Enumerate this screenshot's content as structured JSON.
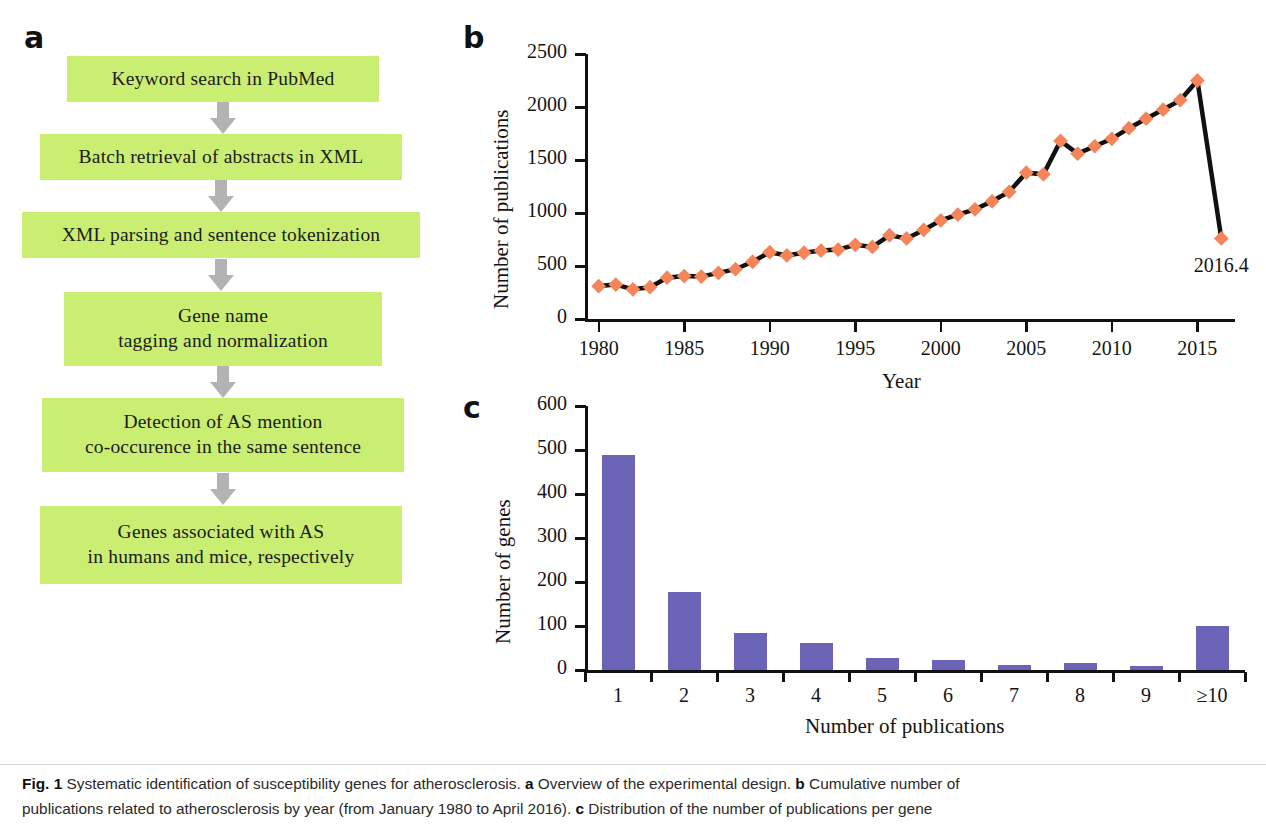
{
  "panels": {
    "a": {
      "letter": "a",
      "steps": [
        "Keyword search in PubMed",
        "Batch retrieval of abstracts in XML",
        "XML parsing and sentence tokenization",
        "Gene name\ntagging and normalization",
        "Detection of AS mention\nco-occurence in the same sentence",
        "Genes associated with AS\nin humans and mice, respectively"
      ],
      "arrow_count": 5,
      "box_color": "#c9ee72",
      "arrow_color": "#b3b3b3"
    },
    "b": {
      "letter": "b"
    },
    "c": {
      "letter": "c"
    }
  },
  "caption": {
    "figure_number": "Fig. 1",
    "line1_part1": " Systematic identification of susceptibility genes for atherosclerosis. ",
    "a_tag": "a",
    "line1_part2": " Overview of the experimental design. ",
    "b_tag": "b",
    "line1_part3": " Cumulative number of",
    "line2_part1": "publications related to atherosclerosis by year (from January 1980 to April 2016). ",
    "c_tag": "c",
    "line2_part2": " Distribution of the number of publications per gene"
  },
  "chart_data": [
    {
      "id": "panel-b",
      "type": "line",
      "title": "",
      "xlabel": "Year",
      "ylabel": "Number of publications",
      "xlim": [
        1979.2,
        2017.2
      ],
      "ylim": [
        0,
        2500
      ],
      "yticks": [
        0,
        500,
        1000,
        1500,
        2000,
        2500
      ],
      "xticks": [
        1980,
        1985,
        1990,
        1995,
        2000,
        2005,
        2010,
        2015
      ],
      "grid": false,
      "legend": "none",
      "marker": "diamond",
      "marker_color": "#f4855a",
      "line_color": "#111111",
      "annotation": {
        "text": "2016.4",
        "x": 2016.4,
        "y": 760
      },
      "x": [
        1980,
        1981,
        1982,
        1983,
        1984,
        1985,
        1986,
        1987,
        1988,
        1989,
        1990,
        1991,
        1992,
        1993,
        1994,
        1995,
        1996,
        1997,
        1998,
        1999,
        2000,
        2001,
        2002,
        2003,
        2004,
        2005,
        2006,
        2007,
        2008,
        2009,
        2010,
        2011,
        2012,
        2013,
        2014,
        2015,
        2016.4
      ],
      "values": [
        310,
        325,
        280,
        300,
        390,
        405,
        400,
        435,
        470,
        540,
        630,
        600,
        625,
        645,
        655,
        700,
        680,
        790,
        760,
        840,
        930,
        985,
        1035,
        1110,
        1200,
        1380,
        1365,
        1680,
        1560,
        1630,
        1700,
        1800,
        1890,
        1975,
        2065,
        2250,
        760
      ]
    },
    {
      "id": "panel-c",
      "type": "bar",
      "title": "",
      "xlabel": "Number of publications",
      "ylabel": "Number of genes",
      "ylim": [
        0,
        600
      ],
      "yticks": [
        0,
        100,
        200,
        300,
        400,
        500,
        600
      ],
      "grid": false,
      "legend": "none",
      "bar_color": "#6b63b5",
      "categories": [
        "1",
        "2",
        "3",
        "4",
        "5",
        "6",
        "7",
        "8",
        "9",
        "≥10"
      ],
      "values": [
        488,
        177,
        83,
        62,
        28,
        23,
        11,
        15,
        8,
        99
      ]
    }
  ]
}
